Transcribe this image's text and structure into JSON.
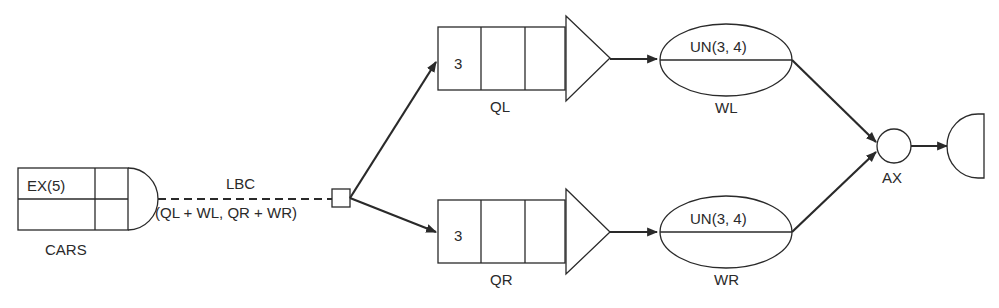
{
  "diagram": {
    "type": "network-simulation-flow",
    "nodes": {
      "create": {
        "label": "CARS",
        "time": "EX(5)"
      },
      "select": {
        "label": "LBC",
        "criteria": "(QL + WL, QR + WR)"
      },
      "queue_left": {
        "label": "QL",
        "capacity": "3"
      },
      "queue_right": {
        "label": "QR",
        "capacity": "3"
      },
      "activity_left": {
        "label": "WL",
        "duration": "UN(3, 4)"
      },
      "activity_right": {
        "label": "WR",
        "duration": "UN(3, 4)"
      },
      "assembly": {
        "label": "AX"
      },
      "terminate": {
        "label": ""
      }
    },
    "edges": [
      {
        "from": "CARS",
        "to": "LBC",
        "style": "dashed"
      },
      {
        "from": "LBC",
        "to": "QL",
        "style": "solid-arrow"
      },
      {
        "from": "LBC",
        "to": "QR",
        "style": "solid-arrow"
      },
      {
        "from": "QL",
        "to": "WL",
        "style": "solid-arrow"
      },
      {
        "from": "QR",
        "to": "WR",
        "style": "solid-arrow"
      },
      {
        "from": "WL",
        "to": "AX",
        "style": "solid-arrow"
      },
      {
        "from": "WR",
        "to": "AX",
        "style": "solid-arrow"
      },
      {
        "from": "AX",
        "to": "terminate",
        "style": "solid-arrow"
      }
    ]
  }
}
